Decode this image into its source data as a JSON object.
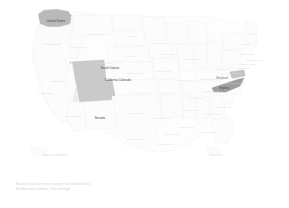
{
  "chart_data": {
    "type": "map",
    "subtype": "choropleth",
    "title": "",
    "region": "United States",
    "projection": "albers-usa",
    "legend_position": "none",
    "grid": false,
    "colors": {
      "background": "#ffffff",
      "state_fill_default": "#fcfcfc",
      "state_border": "#eeeeee",
      "shade_light": "#efefef",
      "shade_medium": "#cfcfcf",
      "shade_dark": "#a8a8a8",
      "label_faint": "#dcdcdc",
      "label_dark": "#3f3f3f"
    },
    "highlighted_states": [
      {
        "name": "Washington",
        "value": 3,
        "shade": "#b9b9b9",
        "label_style": "dark"
      },
      {
        "name": "Wyoming",
        "value": 2,
        "shade": "#cacaca",
        "label_style": "dark"
      },
      {
        "name": "Colorado",
        "value": 2,
        "shade": "#cacaca",
        "label_style": "dark"
      },
      {
        "name": "Nevada",
        "value": 1,
        "shade": "#ededed",
        "label_style": "dark"
      },
      {
        "name": "Virginia",
        "value": 3,
        "shade": "#9f9f9f",
        "label_style": "dark"
      },
      {
        "name": "Maryland",
        "value": 2,
        "shade": "#c2c2c2",
        "label_style": "dark"
      }
    ],
    "labels": [
      {
        "text": "United States",
        "x": 56,
        "y": 21,
        "style": "hi"
      },
      {
        "text": "South Dakota",
        "x": 110,
        "y": 68,
        "style": "hi"
      },
      {
        "text": "California Colorado",
        "x": 118,
        "y": 80,
        "style": "hi"
      },
      {
        "text": "Nevada",
        "x": 100,
        "y": 118,
        "style": "hi"
      },
      {
        "text": "Virginia",
        "x": 224,
        "y": 88,
        "style": "hi"
      },
      {
        "text": "Maryland",
        "x": 222,
        "y": 79,
        "style": "mid"
      },
      {
        "text": "South Dakota",
        "x": 96,
        "y": 35,
        "style": "faint"
      },
      {
        "text": "Wyoming",
        "x": 131,
        "y": 37,
        "style": "faint"
      },
      {
        "text": "South Dakota",
        "x": 159,
        "y": 44,
        "style": "faint"
      },
      {
        "text": "South Dakota",
        "x": 53,
        "y": 45,
        "style": "faint"
      },
      {
        "text": "South Dakota",
        "x": 79,
        "y": 48,
        "style": "faint"
      },
      {
        "text": "Wyoming",
        "x": 131,
        "y": 57,
        "style": "faint"
      },
      {
        "text": "South Dakota",
        "x": 170,
        "y": 55,
        "style": "faint"
      },
      {
        "text": "South Dakota",
        "x": 103,
        "y": 64,
        "style": "faint"
      },
      {
        "text": "South Dakota",
        "x": 135,
        "y": 74,
        "style": "faint"
      },
      {
        "text": "South Dakota",
        "x": 163,
        "y": 72,
        "style": "faint"
      },
      {
        "text": "South Dakota",
        "x": 192,
        "y": 60,
        "style": "faint"
      },
      {
        "text": "South Dakota",
        "x": 186,
        "y": 81,
        "style": "faint"
      },
      {
        "text": "South Dakota",
        "x": 209,
        "y": 80,
        "style": "faint"
      },
      {
        "text": "South Dakota",
        "x": 234,
        "y": 74,
        "style": "faint"
      },
      {
        "text": "South Dakota",
        "x": 223,
        "y": 70,
        "style": "faint"
      },
      {
        "text": "South Dakota",
        "x": 211,
        "y": 92,
        "style": "faint"
      },
      {
        "text": "South Dakota",
        "x": 142,
        "y": 94,
        "style": "faint"
      },
      {
        "text": "South Dakota",
        "x": 167,
        "y": 94,
        "style": "faint"
      },
      {
        "text": "South Dakota",
        "x": 196,
        "y": 99,
        "style": "faint"
      },
      {
        "text": "South Dakota",
        "x": 224,
        "y": 108,
        "style": "faint"
      },
      {
        "text": "South Dakota",
        "x": 190,
        "y": 111,
        "style": "faint"
      },
      {
        "text": "South Dakota",
        "x": 213,
        "y": 115,
        "style": "faint"
      },
      {
        "text": "South Dakota",
        "x": 138,
        "y": 114,
        "style": "faint"
      },
      {
        "text": "South Dakota",
        "x": 162,
        "y": 119,
        "style": "faint"
      },
      {
        "text": "South Dakota",
        "x": 186,
        "y": 128,
        "style": "faint"
      },
      {
        "text": "South Dakota",
        "x": 208,
        "y": 133,
        "style": "faint"
      },
      {
        "text": "South Dakota",
        "x": 172,
        "y": 135,
        "style": "faint"
      },
      {
        "text": "South Dakota",
        "x": 135,
        "y": 140,
        "style": "faint"
      },
      {
        "text": "South Dakota",
        "x": 166,
        "y": 145,
        "style": "faint"
      },
      {
        "text": "South Dakota",
        "x": 58,
        "y": 81,
        "style": "tiny"
      },
      {
        "text": "South Dakota",
        "x": 46,
        "y": 93,
        "style": "tiny"
      },
      {
        "text": "South Dakota",
        "x": 73,
        "y": 116,
        "style": "tiny"
      },
      {
        "text": "Maine",
        "x": 253,
        "y": 34,
        "style": "tiny"
      },
      {
        "text": "Vermont",
        "x": 245,
        "y": 44,
        "style": "tiny"
      },
      {
        "text": "New Hampshire",
        "x": 248,
        "y": 54,
        "style": "tiny"
      },
      {
        "text": "Massachusetts",
        "x": 254,
        "y": 60,
        "style": "tiny"
      },
      {
        "text": "Rhode Island",
        "x": 248,
        "y": 64,
        "style": "tiny"
      },
      {
        "text": "Connecticut",
        "x": 243,
        "y": 68,
        "style": "tiny"
      },
      {
        "text": "New Jersey",
        "x": 240,
        "y": 73,
        "style": "tiny"
      },
      {
        "text": "Delaware",
        "x": 238,
        "y": 78,
        "style": "tiny"
      },
      {
        "text": "District of Columbia",
        "x": 234,
        "y": 83,
        "style": "tiny"
      }
    ],
    "offshore_labels": [
      {
        "text": "Hawaii, United States",
        "x": 55,
        "y": 156
      },
      {
        "text": "Puerto Rico",
        "x": 216,
        "y": 156
      }
    ]
  },
  "caption": {
    "line1": "Based on data for every county of the United States.",
    "line2": "Shaded areas indicate 2020 coverage."
  }
}
